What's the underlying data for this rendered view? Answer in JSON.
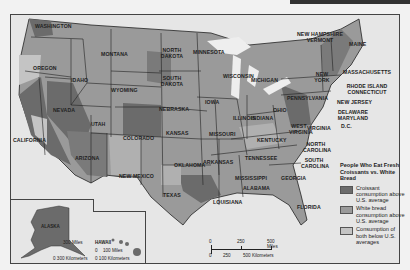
{
  "colors": {
    "croissant": "#6b6b6b",
    "white_bread": "#9a9a9a",
    "both_below": "#c4c4c4",
    "water": "#e9e9e9",
    "border": "#222222"
  },
  "legend": {
    "title": "People Who Eat Fresh Croissants vs. White Bread",
    "items": [
      {
        "key": "croissant",
        "label": "Croissant consumption above U.S. average"
      },
      {
        "key": "white_bread",
        "label": "White bread consumption above U.S. average"
      },
      {
        "key": "both_below",
        "label": "Consumption of both below U.S. averages"
      }
    ]
  },
  "states": {
    "washington": "WASHINGTON",
    "oregon": "OREGON",
    "idaho": "IDAHO",
    "montana": "MONTANA",
    "wyoming": "WYOMING",
    "nevada": "NEVADA",
    "california": "CALIFORNIA",
    "utah": "UTAH",
    "colorado": "COLORADO",
    "arizona": "ARIZONA",
    "new_mexico": "NEW MEXICO",
    "north_dakota": "NORTH DAKOTA",
    "south_dakota": "SOUTH DAKOTA",
    "nebraska": "NEBRASKA",
    "kansas": "KANSAS",
    "oklahoma": "OKLAHOMA",
    "texas": "TEXAS",
    "minnesota": "MINNESOTA",
    "iowa": "IOWA",
    "missouri": "MISSOURI",
    "arkansas": "ARKANSAS",
    "louisiana": "LOUISIANA",
    "wisconsin": "WISCONSIN",
    "illinois": "ILLINOIS",
    "michigan": "MICHIGAN",
    "indiana": "INDIANA",
    "ohio": "OHIO",
    "kentucky": "KENTUCKY",
    "tennessee": "TENNESSEE",
    "mississippi": "MISSISSIPPI",
    "alabama": "ALABAMA",
    "georgia": "GEORGIA",
    "florida": "FLORIDA",
    "south_carolina": "SOUTH CAROLINA",
    "north_carolina": "NORTH CAROLINA",
    "virginia": "VIRGINIA",
    "west_virginia": "WEST VIRGINIA",
    "pennsylvania": "PENNSYLVANIA",
    "new_york": "NEW YORK",
    "maine": "MAINE",
    "nh_vt": "NEW HAMPSHIRE VERMONT",
    "massachusetts": "MASSACHUSETTS",
    "ri_ct": "RHODE ISLAND CONNECTICUT",
    "new_jersey": "NEW JERSEY",
    "de_md": "DELAWARE MARYLAND",
    "dc": "D.C.",
    "alaska": "ALASKA",
    "hawaii": "HAWAII"
  },
  "scale_main": {
    "miles_ticks": [
      "0",
      "250",
      "500 Miles"
    ],
    "km_ticks": [
      "0",
      "250",
      "500 Kilometers"
    ]
  },
  "scale_alaska": {
    "miles": "300 Miles",
    "km": "0 300 Kilometers"
  },
  "scale_hawaii": {
    "miles_zero": "0",
    "miles": "100 Miles",
    "km": "0 100 Kilometers"
  }
}
